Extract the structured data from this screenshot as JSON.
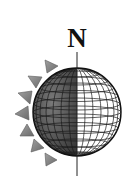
{
  "diagram": {
    "north_label": "N",
    "colors": {
      "background": "#ffffff",
      "dark_side": "#6e6e6e",
      "light_side": "#ffffff",
      "grid": "#1a1a1a",
      "axis": "#222222",
      "sun_rays": "#8a8a8a",
      "sun_ray_edge": "#5a5a5a"
    },
    "globe": {
      "cx": 77,
      "cy": 112,
      "r": 44
    },
    "axis": {
      "x": 77,
      "y1": 52,
      "y2": 176
    },
    "sun_rays_count": 7
  }
}
